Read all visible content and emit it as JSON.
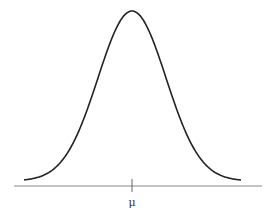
{
  "chart_data": {
    "type": "line",
    "title": "",
    "xlabel": "",
    "ylabel": "",
    "x_ticks": [
      "μ"
    ],
    "series": [
      {
        "name": "normal density",
        "x_sigma": [
          -3,
          -2.5,
          -2,
          -1.5,
          -1,
          -0.5,
          0,
          0.5,
          1,
          1.5,
          2,
          2.5,
          3
        ],
        "y_relative": [
          0.011,
          0.044,
          0.135,
          0.325,
          0.607,
          0.882,
          1.0,
          0.882,
          0.607,
          0.325,
          0.135,
          0.044,
          0.011
        ]
      }
    ],
    "grid": false,
    "legend": null
  },
  "axis": {
    "tick_label": "μ"
  },
  "colors": {
    "curve": "#222222",
    "axis": "#777777"
  }
}
